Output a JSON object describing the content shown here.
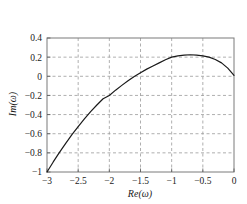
{
  "chart_data": {
    "type": "line",
    "title": "",
    "subtitle": "",
    "xlabel": "Re(ω)",
    "ylabel": "Im(ω)",
    "xlim": [
      -3,
      0
    ],
    "ylim": [
      -1,
      0.4
    ],
    "xticks": [
      -3,
      -2.5,
      -2,
      -1.5,
      -1,
      -0.5,
      0
    ],
    "yticks": [
      0.4,
      0.2,
      0,
      -0.2,
      -0.4,
      -0.6,
      -0.8,
      -1
    ],
    "xticklabels": [
      "−3",
      "−2.5",
      "−2",
      "−1.5",
      "−1",
      "−0.5",
      "0"
    ],
    "yticklabels": [
      "0.4",
      "0.2",
      "0",
      "−0.2",
      "−0.4",
      "−0.6",
      "−0.8",
      "−1"
    ],
    "grid": true,
    "grid_style": "dashed",
    "grid_color": "#9a9a9a",
    "legend": null,
    "legend_position": "none",
    "axes_color": "#7a7a7a",
    "series": [
      {
        "name": "nyquist-locus",
        "color": "#1a1a1a",
        "linewidth": 1.2,
        "x": [
          -3.0,
          -2.9,
          -2.8,
          -2.7,
          -2.6,
          -2.5,
          -2.4,
          -2.3,
          -2.2,
          -2.1,
          -2.0,
          -1.9,
          -1.8,
          -1.7,
          -1.6,
          -1.5,
          -1.4,
          -1.3,
          -1.2,
          -1.1,
          -1.0,
          -0.9,
          -0.8,
          -0.7,
          -0.6,
          -0.5,
          -0.4,
          -0.3,
          -0.2,
          -0.1,
          0.0
        ],
        "y": [
          -1.0,
          -0.895,
          -0.795,
          -0.7,
          -0.61,
          -0.525,
          -0.445,
          -0.37,
          -0.3,
          -0.235,
          -0.2,
          -0.145,
          -0.095,
          -0.047,
          -0.003,
          0.038,
          0.075,
          0.108,
          0.14,
          0.172,
          0.2,
          0.214,
          0.222,
          0.225,
          0.222,
          0.214,
          0.2,
          0.175,
          0.14,
          0.085,
          0.01
        ]
      }
    ],
    "annotations": {
      "start_point": {
        "x": -3,
        "y": -1
      },
      "peak_point": {
        "x": -0.7,
        "y": 0.225
      },
      "zero_crossing": {
        "x": -1.6,
        "y": 0
      },
      "end_point": {
        "x": 0,
        "y": 0.01
      }
    }
  }
}
